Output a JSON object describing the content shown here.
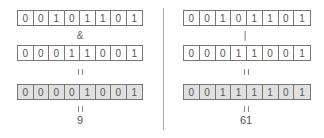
{
  "left": {
    "operand_a": [
      "0",
      "0",
      "1",
      "0",
      "1",
      "1",
      "0",
      "1"
    ],
    "operator": "&",
    "operand_b": [
      "0",
      "0",
      "0",
      "1",
      "1",
      "0",
      "0",
      "1"
    ],
    "result_bits": [
      "0",
      "0",
      "0",
      "0",
      "1",
      "0",
      "0",
      "1"
    ],
    "result_value": "9"
  },
  "right": {
    "operand_a": [
      "0",
      "0",
      "1",
      "0",
      "1",
      "1",
      "0",
      "1"
    ],
    "operator": "|",
    "operand_b": [
      "0",
      "0",
      "0",
      "1",
      "1",
      "0",
      "0",
      "1"
    ],
    "result_bits": [
      "0",
      "0",
      "1",
      "1",
      "1",
      "1",
      "0",
      "1"
    ],
    "result_value": "61"
  }
}
